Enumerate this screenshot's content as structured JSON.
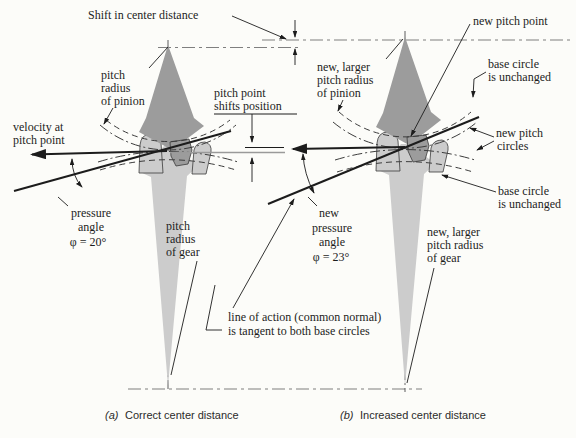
{
  "top": {
    "shift_label": "Shift in center distance"
  },
  "diagram_a": {
    "caption_tag": "(a)",
    "caption": "Correct center distance",
    "labels": {
      "pitch_radius_pinion": [
        "pitch",
        "radius",
        "of pinion"
      ],
      "pitch_point_shifts": [
        "pitch point",
        "shifts position"
      ],
      "velocity": [
        "velocity at",
        "pitch point"
      ],
      "pressure_angle": [
        "pressure",
        "angle",
        "φ = 20°"
      ],
      "pitch_radius_gear": [
        "pitch",
        "radius",
        "of gear"
      ]
    }
  },
  "diagram_b": {
    "caption_tag": "(b)",
    "caption": "Increased center distance",
    "labels": {
      "new_pitch_point": "new pitch point",
      "new_larger_pinion": [
        "new, larger",
        "pitch radius",
        "of pinion"
      ],
      "base_circle_top": [
        "base circle",
        "is unchanged"
      ],
      "new_pitch_circles": [
        "new pitch",
        "circles"
      ],
      "base_circle_bottom": [
        "base circle",
        "is unchanged"
      ],
      "pressure_angle": [
        "new",
        "pressure",
        "angle",
        "φ = 23°"
      ],
      "new_larger_gear": [
        "new, larger",
        "pitch radius",
        "of gear"
      ]
    }
  },
  "shared": {
    "line_of_action": [
      "line of action (common normal)",
      "is tangent to both base circles"
    ]
  },
  "colors": {
    "bg": "#fcfcf9",
    "ink": "#1c1c1c",
    "pinion_fill": "#9c9c9c",
    "gear_fill": "#cccccc",
    "gray_line": "#9a9a9a"
  }
}
